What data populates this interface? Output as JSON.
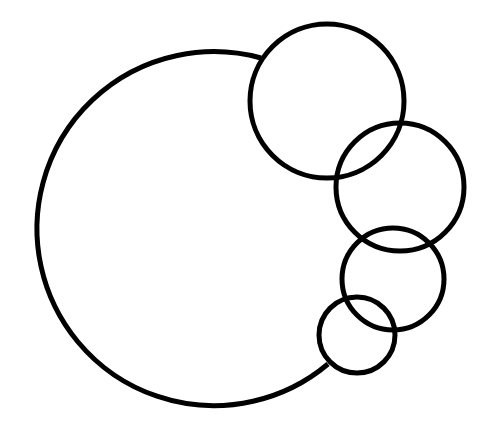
{
  "diagram": {
    "type": "overlapping-circles",
    "stroke_color": "#000000",
    "background": "#ffffff",
    "stroke_width": 5,
    "big_circle": {
      "cx": 213,
      "cy": 229,
      "r": 177,
      "arc_start": [
        261,
        58
      ],
      "arc_end": [
        328,
        364
      ]
    },
    "small_circles": [
      {
        "cx": 327,
        "cy": 101,
        "r": 77
      },
      {
        "cx": 400,
        "cy": 187,
        "r": 64
      },
      {
        "cx": 393,
        "cy": 279,
        "r": 51
      },
      {
        "cx": 357,
        "cy": 335,
        "r": 38
      }
    ]
  }
}
